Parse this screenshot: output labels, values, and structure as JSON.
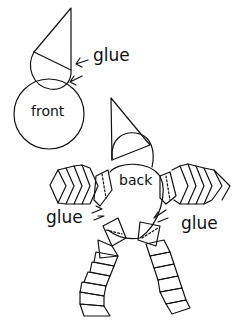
{
  "diagram": {
    "labels": {
      "front": "front",
      "back": "back",
      "glue_top": "glue",
      "glue_left": "glue",
      "glue_right": "glue"
    },
    "colors": {
      "stroke": "#111111",
      "background": "#ffffff"
    }
  }
}
